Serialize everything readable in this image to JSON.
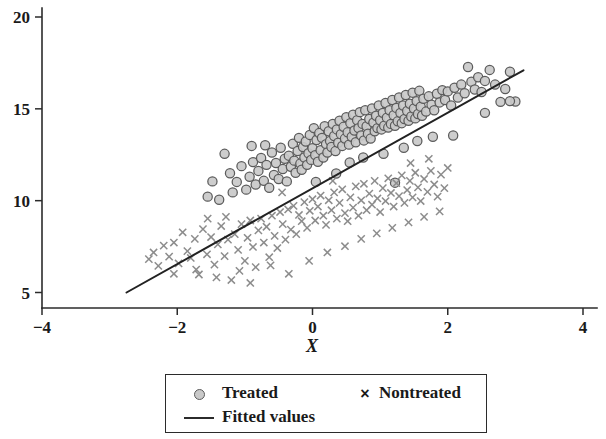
{
  "chart_data": {
    "type": "scatter",
    "title": "",
    "xlabel": "X",
    "ylabel": "",
    "xlim": [
      -4,
      4
    ],
    "ylim": [
      5,
      20
    ],
    "xticks": [
      -4,
      -2,
      0,
      2,
      4
    ],
    "xtick_labels": [
      "−4",
      "−2",
      "0",
      "2",
      "4"
    ],
    "yticks": [
      5,
      10,
      15,
      20
    ],
    "ytick_labels": [
      "5",
      "10",
      "15",
      "20"
    ],
    "grid": false,
    "legend_position": "below-axes",
    "series": [
      {
        "name": "Treated",
        "marker": "circle",
        "marker_fill": "#c9c9c9",
        "marker_edge": "#5b5b5b",
        "points": [
          [
            -1.55,
            10.22
          ],
          [
            -1.38,
            10.05
          ],
          [
            -1.3,
            12.55
          ],
          [
            -1.22,
            11.49
          ],
          [
            -1.12,
            11.02
          ],
          [
            -1.05,
            11.88
          ],
          [
            -0.98,
            10.6
          ],
          [
            -0.93,
            11.3
          ],
          [
            -0.88,
            12.1
          ],
          [
            -0.84,
            10.88
          ],
          [
            -0.8,
            11.62
          ],
          [
            -0.76,
            12.32
          ],
          [
            -0.72,
            11.08
          ],
          [
            -0.68,
            11.95
          ],
          [
            -0.64,
            10.7
          ],
          [
            -0.6,
            12.62
          ],
          [
            -0.57,
            11.4
          ],
          [
            -0.54,
            12.05
          ],
          [
            -0.5,
            11.18
          ],
          [
            -0.47,
            12.88
          ],
          [
            -0.44,
            11.72
          ],
          [
            -0.41,
            12.28
          ],
          [
            -0.38,
            11.05
          ],
          [
            -0.35,
            12.45
          ],
          [
            -0.32,
            11.85
          ],
          [
            -0.29,
            13.1
          ],
          [
            -0.27,
            12.18
          ],
          [
            -0.25,
            11.52
          ],
          [
            -0.22,
            12.7
          ],
          [
            -0.2,
            13.42
          ],
          [
            -0.18,
            12.02
          ],
          [
            -0.16,
            11.68
          ],
          [
            -0.14,
            12.92
          ],
          [
            -0.12,
            12.35
          ],
          [
            -0.1,
            13.22
          ],
          [
            -0.08,
            11.95
          ],
          [
            -0.06,
            12.58
          ],
          [
            -0.04,
            13.58
          ],
          [
            -0.02,
            12.22
          ],
          [
            0.0,
            12.85
          ],
          [
            0.02,
            13.95
          ],
          [
            0.04,
            12.48
          ],
          [
            0.06,
            13.3
          ],
          [
            0.08,
            12.12
          ],
          [
            0.1,
            13.68
          ],
          [
            0.12,
            12.75
          ],
          [
            0.14,
            13.42
          ],
          [
            0.16,
            12.35
          ],
          [
            0.18,
            14.05
          ],
          [
            0.2,
            13.08
          ],
          [
            0.22,
            12.62
          ],
          [
            0.24,
            13.78
          ],
          [
            0.26,
            13.25
          ],
          [
            0.28,
            12.92
          ],
          [
            0.3,
            14.18
          ],
          [
            0.32,
            13.52
          ],
          [
            0.34,
            12.7
          ],
          [
            0.36,
            13.88
          ],
          [
            0.38,
            13.15
          ],
          [
            0.4,
            14.35
          ],
          [
            0.42,
            13.62
          ],
          [
            0.44,
            12.98
          ],
          [
            0.46,
            14.02
          ],
          [
            0.48,
            13.38
          ],
          [
            0.5,
            14.55
          ],
          [
            0.52,
            13.72
          ],
          [
            0.54,
            13.05
          ],
          [
            0.56,
            14.22
          ],
          [
            0.58,
            13.48
          ],
          [
            0.6,
            14.68
          ],
          [
            0.62,
            13.82
          ],
          [
            0.64,
            13.18
          ],
          [
            0.66,
            14.38
          ],
          [
            0.68,
            13.95
          ],
          [
            0.7,
            14.82
          ],
          [
            0.72,
            13.55
          ],
          [
            0.74,
            14.18
          ],
          [
            0.76,
            13.28
          ],
          [
            0.78,
            14.92
          ],
          [
            0.8,
            14.05
          ],
          [
            0.82,
            13.65
          ],
          [
            0.84,
            14.45
          ],
          [
            0.86,
            13.38
          ],
          [
            0.88,
            15.02
          ],
          [
            0.9,
            14.25
          ],
          [
            0.92,
            13.78
          ],
          [
            0.94,
            14.62
          ],
          [
            0.96,
            13.95
          ],
          [
            0.98,
            15.18
          ],
          [
            1.0,
            14.38
          ],
          [
            1.02,
            13.88
          ],
          [
            1.04,
            14.78
          ],
          [
            1.06,
            14.08
          ],
          [
            1.08,
            15.32
          ],
          [
            1.1,
            14.52
          ],
          [
            1.12,
            13.98
          ],
          [
            1.14,
            14.92
          ],
          [
            1.16,
            14.18
          ],
          [
            1.18,
            15.48
          ],
          [
            1.2,
            14.65
          ],
          [
            1.22,
            14.08
          ],
          [
            1.24,
            15.05
          ],
          [
            1.26,
            14.32
          ],
          [
            1.28,
            15.62
          ],
          [
            1.3,
            14.78
          ],
          [
            1.32,
            14.22
          ],
          [
            1.34,
            15.18
          ],
          [
            1.36,
            14.45
          ],
          [
            1.38,
            15.75
          ],
          [
            1.4,
            14.88
          ],
          [
            1.42,
            14.35
          ],
          [
            1.44,
            15.28
          ],
          [
            1.46,
            14.58
          ],
          [
            1.48,
            15.88
          ],
          [
            1.5,
            15.02
          ],
          [
            1.52,
            14.48
          ],
          [
            1.54,
            15.42
          ],
          [
            1.56,
            14.72
          ],
          [
            1.58,
            15.98
          ],
          [
            1.6,
            15.12
          ],
          [
            1.62,
            14.62
          ],
          [
            1.64,
            15.55
          ],
          [
            1.68,
            14.85
          ],
          [
            1.72,
            15.68
          ],
          [
            1.76,
            15.22
          ],
          [
            1.8,
            14.92
          ],
          [
            1.84,
            15.82
          ],
          [
            1.88,
            15.35
          ],
          [
            1.92,
            16.02
          ],
          [
            1.96,
            15.48
          ],
          [
            2.0,
            15.95
          ],
          [
            2.05,
            15.18
          ],
          [
            2.1,
            16.15
          ],
          [
            2.15,
            15.62
          ],
          [
            2.2,
            16.32
          ],
          [
            2.25,
            15.85
          ],
          [
            2.3,
            17.28
          ],
          [
            2.35,
            16.48
          ],
          [
            2.4,
            16.05
          ],
          [
            2.45,
            16.72
          ],
          [
            2.5,
            15.92
          ],
          [
            2.55,
            16.52
          ],
          [
            2.62,
            17.12
          ],
          [
            2.7,
            16.32
          ],
          [
            2.78,
            15.38
          ],
          [
            2.85,
            16.08
          ],
          [
            2.92,
            17.02
          ],
          [
            3.0,
            15.4
          ],
          [
            -1.48,
            11.05
          ],
          [
            -1.18,
            10.45
          ],
          [
            -0.9,
            12.98
          ],
          [
            -0.7,
            13.02
          ],
          [
            0.05,
            11.02
          ],
          [
            0.35,
            11.48
          ],
          [
            0.55,
            12.08
          ],
          [
            0.75,
            12.35
          ],
          [
            1.05,
            12.55
          ],
          [
            1.35,
            12.88
          ],
          [
            1.55,
            13.25
          ],
          [
            1.78,
            13.48
          ],
          [
            2.08,
            13.55
          ],
          [
            1.22,
            10.98
          ],
          [
            2.55,
            14.78
          ],
          [
            2.92,
            15.42
          ]
        ]
      },
      {
        "name": "Nontreated",
        "marker": "x",
        "marker_color": "#8c8c8c",
        "points": [
          [
            -2.42,
            6.82
          ],
          [
            -2.35,
            7.18
          ],
          [
            -2.28,
            6.45
          ],
          [
            -2.2,
            7.55
          ],
          [
            -2.12,
            6.95
          ],
          [
            -2.05,
            7.72
          ],
          [
            -1.98,
            6.58
          ],
          [
            -1.92,
            8.28
          ],
          [
            -1.85,
            7.25
          ],
          [
            -1.8,
            6.88
          ],
          [
            -1.74,
            7.92
          ],
          [
            -1.68,
            5.98
          ],
          [
            -1.62,
            8.45
          ],
          [
            -1.56,
            7.08
          ],
          [
            -1.5,
            8.02
          ],
          [
            -1.45,
            6.52
          ],
          [
            -1.4,
            7.62
          ],
          [
            -1.35,
            8.62
          ],
          [
            -1.3,
            6.98
          ],
          [
            -1.25,
            7.88
          ],
          [
            -1.2,
            5.68
          ],
          [
            -1.15,
            8.18
          ],
          [
            -1.1,
            7.32
          ],
          [
            -1.05,
            8.72
          ],
          [
            -1.0,
            6.72
          ],
          [
            -0.96,
            7.98
          ],
          [
            -0.92,
            8.92
          ],
          [
            -0.88,
            7.48
          ],
          [
            -0.84,
            6.38
          ],
          [
            -0.8,
            8.38
          ],
          [
            -0.76,
            9.02
          ],
          [
            -0.72,
            7.72
          ],
          [
            -0.68,
            8.58
          ],
          [
            -0.64,
            6.92
          ],
          [
            -0.6,
            9.18
          ],
          [
            -0.56,
            8.08
          ],
          [
            -0.52,
            7.42
          ],
          [
            -0.48,
            9.38
          ],
          [
            -0.44,
            8.72
          ],
          [
            -0.4,
            7.88
          ],
          [
            -0.36,
            9.52
          ],
          [
            -0.32,
            8.42
          ],
          [
            -0.28,
            9.72
          ],
          [
            -0.24,
            8.18
          ],
          [
            -0.2,
            9.22
          ],
          [
            -0.16,
            8.88
          ],
          [
            -0.12,
            9.92
          ],
          [
            -0.08,
            8.52
          ],
          [
            -0.04,
            9.45
          ],
          [
            0.0,
            10.08
          ],
          [
            0.04,
            8.92
          ],
          [
            0.08,
            9.68
          ],
          [
            0.12,
            10.28
          ],
          [
            0.16,
            9.18
          ],
          [
            0.2,
            8.68
          ],
          [
            0.24,
            10.02
          ],
          [
            0.28,
            9.48
          ],
          [
            0.32,
            10.45
          ],
          [
            0.36,
            9.02
          ],
          [
            0.4,
            9.88
          ],
          [
            0.44,
            10.62
          ],
          [
            0.48,
            9.32
          ],
          [
            0.52,
            8.88
          ],
          [
            0.56,
            10.18
          ],
          [
            0.6,
            9.62
          ],
          [
            0.64,
            10.78
          ],
          [
            0.68,
            9.18
          ],
          [
            0.72,
            10.02
          ],
          [
            0.76,
            10.92
          ],
          [
            0.8,
            9.48
          ],
          [
            0.84,
            10.38
          ],
          [
            0.88,
            9.78
          ],
          [
            0.92,
            11.08
          ],
          [
            0.96,
            10.12
          ],
          [
            1.0,
            9.38
          ],
          [
            1.04,
            10.68
          ],
          [
            1.08,
            9.98
          ],
          [
            1.12,
            11.22
          ],
          [
            1.16,
            10.42
          ],
          [
            1.2,
            9.68
          ],
          [
            1.24,
            10.95
          ],
          [
            1.28,
            10.25
          ],
          [
            1.32,
            11.38
          ],
          [
            1.36,
            9.88
          ],
          [
            1.4,
            10.58
          ],
          [
            1.44,
            11.08
          ],
          [
            1.48,
            10.18
          ],
          [
            1.52,
            11.52
          ],
          [
            1.56,
            10.72
          ],
          [
            1.6,
            9.98
          ],
          [
            1.65,
            11.18
          ],
          [
            1.7,
            10.48
          ],
          [
            1.75,
            11.62
          ],
          [
            1.8,
            10.88
          ],
          [
            1.85,
            10.22
          ],
          [
            1.9,
            11.42
          ],
          [
            1.95,
            10.68
          ],
          [
            2.0,
            11.78
          ],
          [
            -2.05,
            6.02
          ],
          [
            -1.72,
            6.25
          ],
          [
            -1.42,
            5.82
          ],
          [
            -1.08,
            6.18
          ],
          [
            -0.92,
            5.52
          ],
          [
            -0.62,
            6.48
          ],
          [
            -0.35,
            6.02
          ],
          [
            -0.05,
            6.72
          ],
          [
            0.22,
            7.18
          ],
          [
            0.48,
            7.52
          ],
          [
            0.72,
            7.92
          ],
          [
            0.95,
            8.22
          ],
          [
            1.18,
            8.52
          ],
          [
            1.42,
            8.82
          ],
          [
            1.65,
            9.12
          ],
          [
            1.88,
            9.42
          ],
          [
            -1.55,
            9.02
          ],
          [
            -1.28,
            9.12
          ],
          [
            -0.45,
            10.45
          ],
          [
            0.3,
            11.08
          ],
          [
            1.45,
            12.05
          ],
          [
            1.72,
            12.28
          ]
        ]
      }
    ],
    "fit_line": {
      "name": "Fitted values",
      "color": "#222222",
      "x_start": -2.75,
      "y_start": 5.0,
      "x_end": 3.12,
      "y_end": 17.1,
      "slope": 2.06,
      "intercept": 10.67
    }
  },
  "axes": {
    "x_title": "X"
  },
  "legend": {
    "entries": [
      {
        "label": "Treated",
        "key": "circle-marker-icon"
      },
      {
        "label": "Nontreated",
        "key": "cross-marker-icon"
      },
      {
        "label": "Fitted values",
        "key": "line-sample-icon"
      }
    ]
  }
}
